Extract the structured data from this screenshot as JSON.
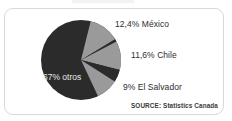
{
  "figure": {
    "background_color": "#ffffff",
    "border_color": "#d9d9d9"
  },
  "labels": {
    "mexico": "12,4% México",
    "chile": "11,6% Chile",
    "el_salvador": "9% El Salvador",
    "otros": "67% otros"
  },
  "source": {
    "text": "SOURCE: Statistics Canada"
  },
  "chart_data": {
    "type": "pie",
    "title": "",
    "subtitle": "",
    "xlabel": "",
    "ylabel": "",
    "legend_position": "none",
    "grid": false,
    "labels_as_shown": [
      "12,4% México",
      "11,6% Chile",
      "9% El Salvador",
      "67% otros"
    ],
    "categories": [
      "México",
      "Chile",
      "El Salvador",
      "otros"
    ],
    "values": [
      12.4,
      11.6,
      9.0,
      67.0
    ],
    "value_unit": "%",
    "colors": [
      "#9a9a9a",
      "#9a9a9a",
      "#9a9a9a",
      "#2b2b2b"
    ],
    "slice_colors": {
      "highlight": "#9a9a9a",
      "other": "#2b2b2b"
    },
    "annotations": [
      "SOURCE: Statistics Canada"
    ],
    "geometry": {
      "center_x": 40,
      "center_y": 40,
      "radius": 40,
      "start_angle_deg": 0,
      "direction": "clockwise"
    },
    "slice_order_clockwise_from_top": [
      "otros-part",
      "México",
      "otros-gap",
      "Chile",
      "otros-gap",
      "El Salvador",
      "otros"
    ]
  }
}
